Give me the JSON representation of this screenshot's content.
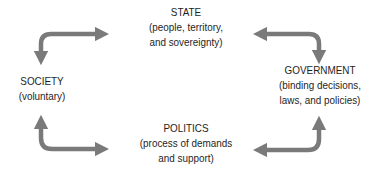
{
  "diagram": {
    "nodes": {
      "state": {
        "title": "STATE",
        "lines": [
          "(people, territory,",
          "and sovereignty)"
        ]
      },
      "society": {
        "title": "SOCIETY",
        "lines": [
          "(voluntary)"
        ]
      },
      "government": {
        "title": "GOVERNMENT",
        "lines": [
          "(binding decisions,",
          "laws, and policies)"
        ]
      },
      "politics": {
        "title": "POLITICS",
        "lines": [
          "(process of demands",
          "and support)"
        ]
      }
    },
    "edges": [
      {
        "from": "society",
        "to": "state",
        "style": "bidirectional-curved"
      },
      {
        "from": "state",
        "to": "government",
        "style": "bidirectional-curved"
      },
      {
        "from": "society",
        "to": "politics",
        "style": "bidirectional-curved"
      },
      {
        "from": "politics",
        "to": "government",
        "style": "bidirectional-curved"
      }
    ],
    "colors": {
      "arrow": "#7a7a7a",
      "text": "#1e1e1e",
      "background": "#ffffff"
    }
  }
}
